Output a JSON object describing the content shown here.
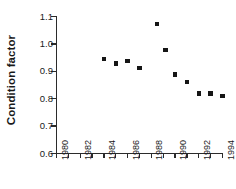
{
  "chart_data": {
    "type": "scatter",
    "title": "",
    "xlabel": "",
    "ylabel": "Condition factor",
    "xlim": [
      1980,
      1994
    ],
    "ylim": [
      0.6,
      1.1
    ],
    "grid": false,
    "legend": null,
    "y_ticks": [
      "1.1",
      "1.0",
      "0.9",
      "0.8",
      "0.7",
      "0.6"
    ],
    "y_tick_values": [
      1.1,
      1.0,
      0.9,
      0.8,
      0.7,
      0.6
    ],
    "x_ticks": [
      "1980",
      "1982",
      "1984",
      "1986",
      "1988",
      "1990",
      "1992",
      "1994"
    ],
    "x_tick_values": [
      1980,
      1982,
      1984,
      1986,
      1988,
      1990,
      1992,
      1994
    ],
    "x_minor_tick_values": [
      1980,
      1981,
      1982,
      1983,
      1984,
      1985,
      1986,
      1987,
      1988,
      1989,
      1990,
      1991,
      1992,
      1993,
      1994
    ],
    "marker": "filled-square",
    "marker_color": "#151515",
    "x": [
      1984,
      1985,
      1986,
      1987,
      1988.5,
      1989,
      1989.5,
      1990,
      1991,
      1992,
      1993,
      1994
    ],
    "y": [
      0.944,
      0.928,
      0.938,
      0.911,
      1.073,
      0.978,
      0.889,
      0.861,
      0.819,
      0.819,
      0.81,
      0.81
    ],
    "points": [
      {
        "x": 1984,
        "y": 0.944
      },
      {
        "x": 1985,
        "y": 0.928
      },
      {
        "x": 1986,
        "y": 0.938
      },
      {
        "x": 1987,
        "y": 0.911
      },
      {
        "x": 1988.5,
        "y": 1.073
      },
      {
        "x": 1989.2,
        "y": 0.978
      },
      {
        "x": 1990,
        "y": 0.889
      },
      {
        "x": 1991,
        "y": 0.861
      },
      {
        "x": 1992,
        "y": 0.819
      },
      {
        "x": 1993,
        "y": 0.819
      },
      {
        "x": 1994,
        "y": 0.81
      }
    ],
    "colors": {
      "axis": "#2b2b2b",
      "text": "#1a1a1a",
      "marker": "#151515",
      "background": "#ffffff"
    }
  }
}
